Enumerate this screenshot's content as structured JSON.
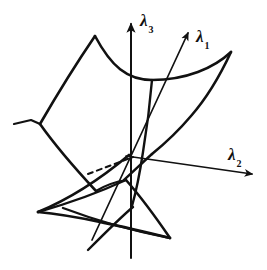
{
  "figure": {
    "kind": "hand-drawn-mathematical-diagram",
    "title": "",
    "background_color": "#ffffff",
    "ink_color": "#111111",
    "axes": [
      {
        "id": "lambda-3",
        "symbol": "λ",
        "subscript": "3",
        "direction": "vertical-up",
        "arrow": true
      },
      {
        "id": "lambda-1",
        "symbol": "λ",
        "subscript": "1",
        "direction": "upper-right-oblique",
        "arrow": true
      },
      {
        "id": "lambda-2",
        "symbol": "λ",
        "subscript": "2",
        "direction": "right-down-oblique",
        "arrow": true
      }
    ],
    "strokes": {
      "solid_count": 14,
      "dashed_count": 1,
      "line_width": 2.2
    }
  },
  "labels": {
    "lambda3": "λ",
    "lambda3_sub": "3",
    "lambda1": "λ",
    "lambda1_sub": "1",
    "lambda2": "λ",
    "lambda2_sub": "2"
  }
}
